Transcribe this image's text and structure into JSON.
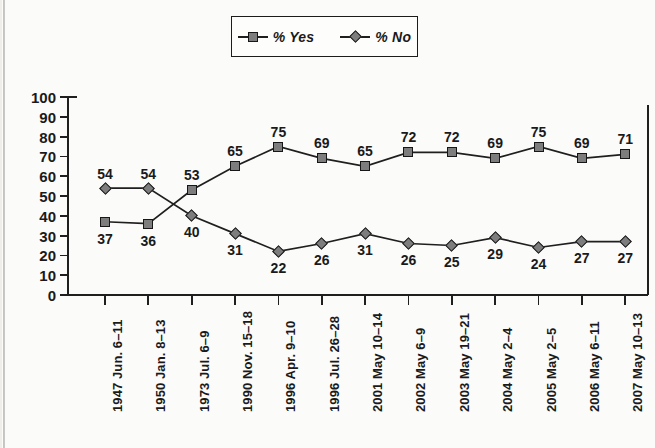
{
  "background_color": "#fbfbfa",
  "marker_fill": "#7d7d7d",
  "marker_stroke": "#171717",
  "line_color": "#1f1f1f",
  "legend": {
    "position": "top-center",
    "entries": [
      {
        "label": "% Yes",
        "marker": "square-marker-icon"
      },
      {
        "label": "% No",
        "marker": "diamond-marker-icon"
      }
    ]
  },
  "chart_data": {
    "type": "line",
    "title": "",
    "xlabel": "",
    "ylabel": "",
    "ylim": [
      0,
      100
    ],
    "yticks": [
      0,
      10,
      20,
      30,
      40,
      50,
      60,
      70,
      80,
      90,
      100
    ],
    "grid": false,
    "legend_position": "top-center",
    "categories": [
      "1947 Jun. 6–11",
      "1950 Jan. 8–13",
      "1973 Jul. 6–9",
      "1990 Nov. 15–18",
      "1996 Apr. 9–10",
      "1996 Jul. 26–28",
      "2001 May 10–14",
      "2002 May 6–9",
      "2003 May 19–21",
      "2004 May 2–4",
      "2005 May 2–5",
      "2006 May 6–11",
      "2007 May 10–13"
    ],
    "series": [
      {
        "name": "% Yes",
        "marker": "square",
        "values": [
          37,
          36,
          53,
          65,
          75,
          69,
          65,
          72,
          72,
          69,
          75,
          69,
          71
        ],
        "label_positions": [
          "below",
          "below",
          "above",
          "above",
          "above",
          "above",
          "above",
          "above",
          "above",
          "above",
          "above",
          "above",
          "above"
        ]
      },
      {
        "name": "% No",
        "marker": "diamond",
        "values": [
          54,
          54,
          40,
          31,
          22,
          26,
          31,
          26,
          25,
          29,
          24,
          27,
          27
        ],
        "label_positions": [
          "above",
          "above",
          "below",
          "below",
          "below",
          "below",
          "below",
          "below",
          "below",
          "below",
          "below",
          "below",
          "below"
        ]
      }
    ]
  }
}
